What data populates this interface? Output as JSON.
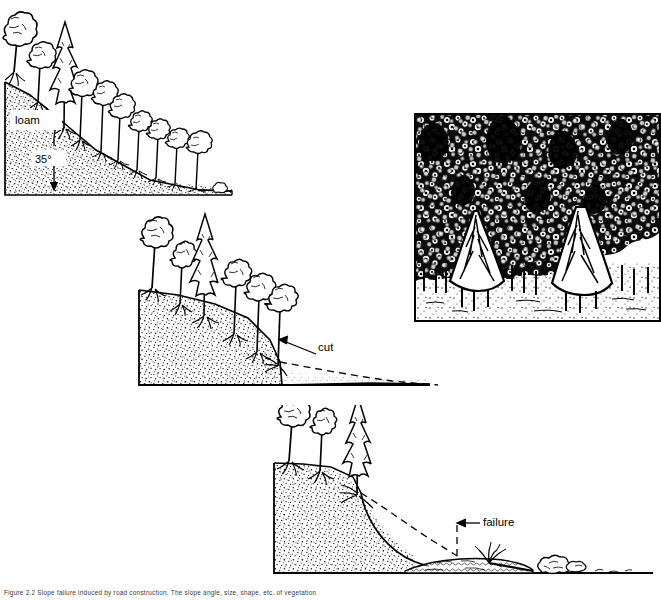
{
  "figure": {
    "caption_number": "Figure 2.2",
    "caption_text": "Slope failure induced by road construction. The slope angle, size, shape, etc. of vegetation",
    "background_color": "#ffffff",
    "ink_color": "#000000"
  },
  "panels": [
    {
      "id": "panel-intact-slope",
      "name": "Intact forested slope",
      "order": 1,
      "labels": {
        "soil_type": "loam",
        "slope_angle": "35°"
      },
      "tree_count": 11,
      "state": "stable"
    },
    {
      "id": "panel-cut-slope",
      "name": "Slope with road cut",
      "order": 2,
      "labels": {
        "annotation": "cut"
      },
      "tree_count": 6,
      "state": "undercut"
    },
    {
      "id": "panel-failed-slope",
      "name": "Slope after failure",
      "order": 3,
      "labels": {
        "annotation": "failure"
      },
      "tree_count": 3,
      "state": "failed"
    },
    {
      "id": "panel-canopy-photo",
      "name": "Forest canopy halftone photograph",
      "order": 4,
      "labels": {},
      "state": "photograph"
    }
  ],
  "annotations": {
    "loam": "loam",
    "angle": "35°",
    "cut": "cut",
    "failure": "failure"
  }
}
